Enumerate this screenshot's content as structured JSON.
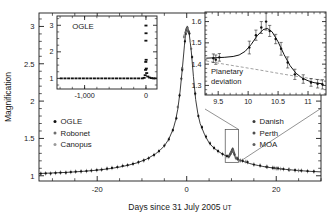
{
  "figure": {
    "name": "microlensing-light-curve",
    "background": "#ffffff"
  },
  "main_axes": {
    "ylabel": "Magnification",
    "xlabel_main": "Days since 31 July 2005",
    "xlabel_unit": "UT",
    "xticks": [
      "-20",
      "0",
      "20"
    ],
    "xtick_values": [
      -20,
      0,
      20
    ],
    "yticks": [
      "1",
      "1.5",
      "2",
      "2.5",
      "3"
    ],
    "ytick_values": [
      1,
      1.5,
      2,
      2.5,
      3
    ],
    "xlim": [
      -33,
      30
    ],
    "ylim": [
      0.93,
      3.18
    ]
  },
  "legend_left": {
    "items": [
      {
        "label": "OGLE",
        "color": "#111111"
      },
      {
        "label": "Robonet",
        "color": "#6e6e6e"
      },
      {
        "label": "Canopus",
        "color": "#9a9a9a"
      }
    ]
  },
  "legend_right": {
    "items": [
      {
        "label": "Danish",
        "color": "#3a3a3a"
      },
      {
        "label": "Perth",
        "color": "#4d4d4d"
      },
      {
        "label": "MOA",
        "color": "#5f5f5f"
      }
    ]
  },
  "inset_left": {
    "title": "OGLE",
    "xticks": [
      "-1,000",
      "0"
    ],
    "xtick_values": [
      -1000,
      0
    ],
    "yticks": [
      "1",
      "2",
      "3"
    ],
    "ytick_values": [
      1,
      2,
      3
    ],
    "xlim": [
      -1450,
      180
    ],
    "ylim": [
      0.6,
      3.35
    ]
  },
  "inset_right": {
    "annotation_line1": "Planetary",
    "annotation_line2": "deviation",
    "xticks": [
      "9.5",
      "10",
      "10.5",
      "11"
    ],
    "xtick_values": [
      9.5,
      10,
      10.5,
      11
    ],
    "yticks": [
      "1.3",
      "1.4",
      "1.5",
      "1.6"
    ],
    "ytick_values": [
      1.3,
      1.4,
      1.5,
      1.6
    ],
    "xlim": [
      9.28,
      11.3
    ],
    "ylim": [
      1.255,
      1.645
    ]
  },
  "chart_data": {
    "type": "scatter",
    "title": "",
    "xlabel": "Days since 31 July 2005 UT",
    "ylabel": "Magnification",
    "xlim": [
      -33,
      30
    ],
    "ylim": [
      0.93,
      3.18
    ],
    "grid": false,
    "legend_position": "inside-left-and-right",
    "model_curve": {
      "name": "best-fit binary-lens model",
      "description": "Point-lens Paczynski curve peaking at magnification 3.0 near day 0, with a short planetary perturbation near day 10.",
      "t0": 0.2,
      "peak_magnification": 3.0,
      "baseline_magnification": 1.0,
      "points": [
        [
          -33,
          1.03
        ],
        [
          -31,
          1.035
        ],
        [
          -29,
          1.04
        ],
        [
          -27,
          1.045
        ],
        [
          -25,
          1.052
        ],
        [
          -23,
          1.06
        ],
        [
          -21,
          1.07
        ],
        [
          -19,
          1.082
        ],
        [
          -17,
          1.097
        ],
        [
          -15,
          1.117
        ],
        [
          -13,
          1.142
        ],
        [
          -11,
          1.175
        ],
        [
          -9,
          1.222
        ],
        [
          -7,
          1.292
        ],
        [
          -6,
          1.34
        ],
        [
          -5,
          1.4
        ],
        [
          -4,
          1.49
        ],
        [
          -3,
          1.63
        ],
        [
          -2.5,
          1.74
        ],
        [
          -2,
          1.89
        ],
        [
          -1.5,
          2.12
        ],
        [
          -1,
          2.42
        ],
        [
          -0.5,
          2.75
        ],
        [
          -0.2,
          2.93
        ],
        [
          0,
          2.99
        ],
        [
          0.2,
          3.0
        ],
        [
          0.5,
          2.93
        ],
        [
          1,
          2.68
        ],
        [
          1.5,
          2.33
        ],
        [
          2,
          2.02
        ],
        [
          2.5,
          1.83
        ],
        [
          3,
          1.7
        ],
        [
          4,
          1.55
        ],
        [
          5,
          1.44
        ],
        [
          6,
          1.375
        ],
        [
          7,
          1.33
        ],
        [
          8,
          1.29
        ],
        [
          9,
          1.26
        ],
        [
          9.5,
          1.25
        ],
        [
          10,
          1.3
        ],
        [
          10.3,
          1.35
        ],
        [
          10.6,
          1.29
        ],
        [
          11,
          1.235
        ],
        [
          12,
          1.205
        ],
        [
          13,
          1.185
        ],
        [
          14,
          1.165
        ],
        [
          15,
          1.15
        ],
        [
          16,
          1.137
        ],
        [
          17,
          1.125
        ],
        [
          18,
          1.115
        ],
        [
          19,
          1.107
        ],
        [
          20,
          1.1
        ],
        [
          22,
          1.086
        ],
        [
          24,
          1.075
        ],
        [
          26,
          1.066
        ],
        [
          28,
          1.058
        ],
        [
          30,
          1.052
        ]
      ]
    },
    "series": [
      {
        "name": "OGLE",
        "color": "#111111",
        "points": [
          [
            -32.6,
            1.028
          ],
          [
            -31.5,
            1.032
          ],
          [
            -30.4,
            1.03
          ],
          [
            -29.3,
            1.038
          ],
          [
            -28.2,
            1.042
          ],
          [
            -27.0,
            1.041
          ],
          [
            -25.9,
            1.05
          ],
          [
            -24.8,
            1.055
          ],
          [
            -23.6,
            1.058
          ],
          [
            -22.4,
            1.063
          ],
          [
            -21.3,
            1.07
          ],
          [
            -20.1,
            1.076
          ],
          [
            -19.0,
            1.082
          ],
          [
            -17.8,
            1.095
          ],
          [
            -16.7,
            1.105
          ],
          [
            -15.5,
            1.117
          ],
          [
            -14.3,
            1.133
          ],
          [
            -13.2,
            1.142
          ],
          [
            -12.0,
            1.16
          ],
          [
            -10.8,
            1.181
          ],
          [
            -9.6,
            1.205
          ],
          [
            -8.5,
            1.234
          ],
          [
            -7.3,
            1.278
          ],
          [
            -6.2,
            1.33
          ],
          [
            -5.0,
            1.405
          ],
          [
            -4.0,
            1.488
          ],
          [
            -3.1,
            1.61
          ],
          [
            -2.3,
            1.77
          ],
          [
            -1.6,
            2.075
          ],
          [
            -1.0,
            2.42
          ],
          [
            -0.4,
            2.8
          ],
          [
            0.1,
            2.98
          ],
          [
            0.6,
            2.905
          ],
          [
            1.2,
            2.59
          ],
          [
            1.9,
            2.1
          ],
          [
            2.6,
            1.8
          ],
          [
            3.4,
            1.65
          ],
          [
            4.3,
            1.525
          ],
          [
            5.2,
            1.435
          ],
          [
            6.1,
            1.372
          ],
          [
            7.0,
            1.33
          ],
          [
            8.0,
            1.29
          ],
          [
            9.0,
            1.262
          ],
          [
            10.2,
            1.35
          ],
          [
            11.3,
            1.228
          ],
          [
            12.5,
            1.2
          ],
          [
            13.6,
            1.183
          ],
          [
            15.0,
            1.15
          ],
          [
            16.4,
            1.136
          ],
          [
            17.8,
            1.12
          ],
          [
            19.2,
            1.106
          ],
          [
            20.4,
            1.099
          ],
          [
            21.6,
            1.09
          ],
          [
            22.8,
            1.082
          ],
          [
            24.2,
            1.074
          ],
          [
            25.6,
            1.068
          ],
          [
            27.0,
            1.062
          ],
          [
            28.4,
            1.057
          ]
        ]
      },
      {
        "name": "Robonet",
        "color": "#6e6e6e",
        "points": [
          [
            -0.6,
            2.86
          ],
          [
            -0.3,
            2.92
          ],
          [
            0.0,
            2.96
          ],
          [
            0.3,
            2.94
          ],
          [
            9.8,
            1.3
          ],
          [
            10.1,
            1.335
          ],
          [
            10.5,
            1.315
          ],
          [
            13.2,
            1.19
          ]
        ]
      },
      {
        "name": "Canopus",
        "color": "#9a9a9a",
        "points": [
          [
            -0.5,
            2.88
          ],
          [
            0.2,
            2.97
          ],
          [
            0.8,
            2.8
          ],
          [
            9.6,
            1.275
          ],
          [
            10.0,
            1.322
          ],
          [
            10.4,
            1.328
          ],
          [
            10.9,
            1.245
          ]
        ]
      },
      {
        "name": "Danish",
        "color": "#3a3a3a",
        "points": [
          [
            -1.2,
            2.3
          ],
          [
            -0.2,
            2.9
          ],
          [
            0.5,
            2.92
          ],
          [
            9.4,
            1.258
          ],
          [
            10.0,
            1.318
          ],
          [
            10.3,
            1.352
          ],
          [
            10.7,
            1.282
          ],
          [
            11.4,
            1.225
          ],
          [
            18.0,
            1.118
          ],
          [
            19.5,
            1.104
          ]
        ]
      },
      {
        "name": "Perth",
        "color": "#4d4d4d",
        "points": [
          [
            -0.1,
            2.95
          ],
          [
            0.4,
            2.93
          ],
          [
            9.7,
            1.288
          ],
          [
            10.2,
            1.345
          ],
          [
            10.6,
            1.3
          ],
          [
            12.0,
            1.205
          ],
          [
            20.0,
            1.098
          ]
        ]
      },
      {
        "name": "MOA",
        "color": "#5f5f5f",
        "points": [
          [
            -2.0,
            1.92
          ],
          [
            -1.0,
            2.44
          ],
          [
            0.0,
            2.97
          ],
          [
            1.0,
            2.7
          ],
          [
            9.9,
            1.312
          ],
          [
            10.4,
            1.34
          ],
          [
            11.0,
            1.238
          ],
          [
            21.0,
            1.092
          ],
          [
            23.0,
            1.08
          ],
          [
            25.0,
            1.07
          ]
        ]
      }
    ],
    "inset_left_data": {
      "type": "scatter",
      "title": "OGLE",
      "description": "Full OGLE baseline light curve over ~4 years showing flat magnification 1 until the 2005 event spike.",
      "xlabel": "",
      "ylabel": "",
      "xlim": [
        -1450,
        180
      ],
      "ylim": [
        0.6,
        3.35
      ],
      "xticks": [
        -1000,
        0
      ],
      "yticks": [
        1,
        2,
        3
      ],
      "points": [
        [
          -1380,
          1.0
        ],
        [
          -1320,
          1.0
        ],
        [
          -1260,
          1.0
        ],
        [
          -1200,
          1.0
        ],
        [
          -1140,
          1.0
        ],
        [
          -1080,
          1.0
        ],
        [
          -1020,
          1.0
        ],
        [
          -960,
          1.0
        ],
        [
          -900,
          1.0
        ],
        [
          -840,
          1.0
        ],
        [
          -780,
          1.0
        ],
        [
          -720,
          1.0
        ],
        [
          -660,
          1.0
        ],
        [
          -600,
          1.0
        ],
        [
          -540,
          1.0
        ],
        [
          -480,
          1.0
        ],
        [
          -420,
          1.0
        ],
        [
          -360,
          1.0
        ],
        [
          -300,
          1.0
        ],
        [
          -240,
          1.0
        ],
        [
          -180,
          1.0
        ],
        [
          -120,
          1.0
        ],
        [
          -60,
          1.0
        ],
        [
          -30,
          1.02
        ],
        [
          -12,
          1.12
        ],
        [
          -6,
          1.32
        ],
        [
          -3,
          1.62
        ],
        [
          -1,
          2.42
        ],
        [
          0,
          2.99
        ],
        [
          1,
          2.7
        ],
        [
          3,
          1.7
        ],
        [
          6,
          1.37
        ],
        [
          12,
          1.2
        ],
        [
          30,
          1.07
        ],
        [
          60,
          1.03
        ],
        [
          90,
          1.01
        ],
        [
          120,
          1.0
        ],
        [
          150,
          1.0
        ]
      ]
    },
    "inset_right_data": {
      "type": "scatter",
      "description": "Zoom on the planetary deviation between day 9.3 and 11.3; model with planet (solid) vs single-lens model (dashed).",
      "xlabel": "",
      "ylabel": "",
      "xlim": [
        9.28,
        11.3
      ],
      "ylim": [
        1.255,
        1.645
      ],
      "xticks": [
        9.5,
        10,
        10.5,
        11
      ],
      "yticks": [
        1.3,
        1.4,
        1.5,
        1.6
      ],
      "annotation": "Planetary deviation",
      "model_with_planet": [
        [
          9.3,
          1.428
        ],
        [
          9.45,
          1.43
        ],
        [
          9.6,
          1.432
        ],
        [
          9.75,
          1.436
        ],
        [
          9.85,
          1.443
        ],
        [
          9.95,
          1.46
        ],
        [
          10.05,
          1.492
        ],
        [
          10.15,
          1.533
        ],
        [
          10.25,
          1.562
        ],
        [
          10.32,
          1.568
        ],
        [
          10.4,
          1.552
        ],
        [
          10.5,
          1.505
        ],
        [
          10.6,
          1.445
        ],
        [
          10.7,
          1.393
        ],
        [
          10.8,
          1.357
        ],
        [
          10.9,
          1.335
        ],
        [
          11.0,
          1.322
        ],
        [
          11.1,
          1.313
        ],
        [
          11.25,
          1.307
        ]
      ],
      "model_single_lens": [
        [
          9.3,
          1.415
        ],
        [
          9.6,
          1.4
        ],
        [
          9.9,
          1.386
        ],
        [
          10.2,
          1.372
        ],
        [
          10.5,
          1.357
        ],
        [
          10.8,
          1.343
        ],
        [
          11.1,
          1.33
        ],
        [
          11.28,
          1.322
        ]
      ],
      "points": [
        {
          "x": 9.42,
          "y": 1.428,
          "err": 0.02,
          "series": "OGLE"
        },
        {
          "x": 9.46,
          "y": 1.421,
          "err": 0.022,
          "series": "Danish"
        },
        {
          "x": 9.52,
          "y": 1.432,
          "err": 0.018,
          "series": "Perth"
        },
        {
          "x": 10.02,
          "y": 1.478,
          "err": 0.03,
          "series": "Robonet"
        },
        {
          "x": 10.13,
          "y": 1.536,
          "err": 0.024,
          "series": "Canopus"
        },
        {
          "x": 10.22,
          "y": 1.572,
          "err": 0.028,
          "series": "Danish"
        },
        {
          "x": 10.3,
          "y": 1.6,
          "err": 0.04,
          "series": "MOA"
        },
        {
          "x": 10.36,
          "y": 1.556,
          "err": 0.026,
          "series": "OGLE"
        },
        {
          "x": 10.46,
          "y": 1.518,
          "err": 0.022,
          "series": "Perth"
        },
        {
          "x": 10.55,
          "y": 1.472,
          "err": 0.03,
          "series": "Robonet"
        },
        {
          "x": 10.66,
          "y": 1.408,
          "err": 0.026,
          "series": "Canopus"
        },
        {
          "x": 10.78,
          "y": 1.352,
          "err": 0.024,
          "series": "Danish"
        },
        {
          "x": 10.92,
          "y": 1.33,
          "err": 0.02,
          "series": "Perth"
        },
        {
          "x": 11.05,
          "y": 1.314,
          "err": 0.018,
          "series": "OGLE"
        },
        {
          "x": 11.16,
          "y": 1.308,
          "err": 0.02,
          "series": "MOA"
        },
        {
          "x": 11.24,
          "y": 1.305,
          "err": 0.022,
          "series": "Canopus"
        }
      ]
    }
  }
}
